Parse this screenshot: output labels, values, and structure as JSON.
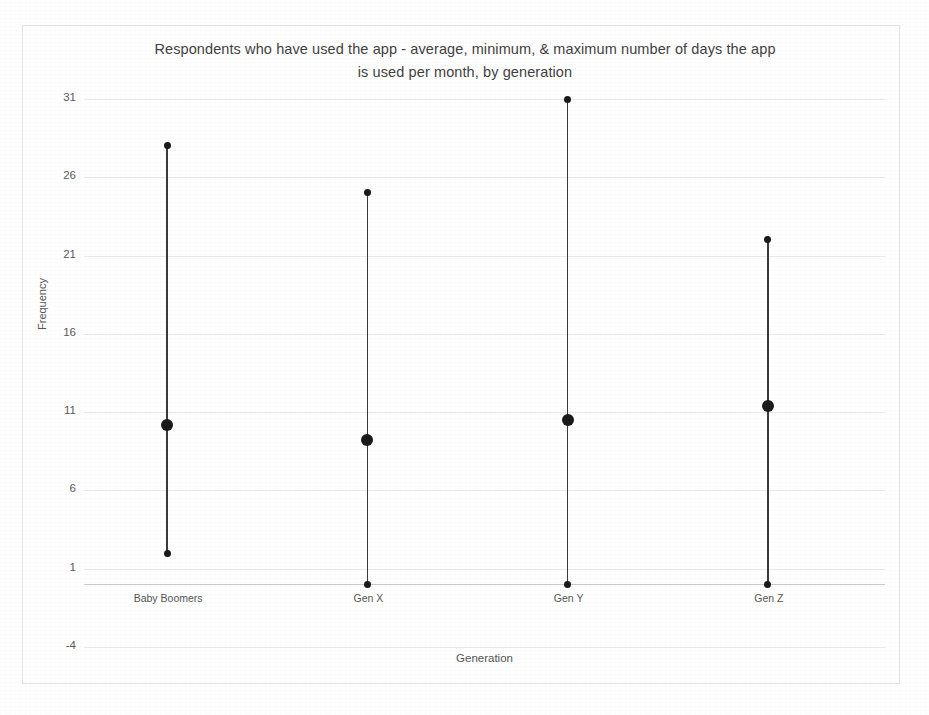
{
  "chart_data": {
    "type": "scatter",
    "title": "Respondents who have used the app - average, minimum, & maximum number of days the app is used per month, by generation",
    "title_line1": "Respondents  who have used the app - average, minimum, & maximum number of days the app",
    "title_line2": "is used per month, by generation",
    "xlabel": "Generation",
    "ylabel": "Frequency",
    "ylim": [
      -4,
      31
    ],
    "yticks": [
      31,
      26,
      21,
      16,
      11,
      6,
      1,
      -4
    ],
    "ytick_labels": [
      "31",
      "26",
      "21",
      "16",
      "11",
      "6",
      "1",
      "-4"
    ],
    "grid": true,
    "legend": "none",
    "categories": [
      "Baby Boomers",
      "Gen X",
      "Gen Y",
      "Gen Z"
    ],
    "series": [
      {
        "name": "minimum",
        "values": [
          2,
          0,
          0,
          0
        ]
      },
      {
        "name": "average",
        "values": [
          10.2,
          9.2,
          10.5,
          11.4
        ]
      },
      {
        "name": "maximum",
        "values": [
          28,
          25,
          31,
          22
        ]
      }
    ],
    "points": [
      {
        "category": "Baby Boomers",
        "minimum": 2,
        "average": 10.2,
        "maximum": 28
      },
      {
        "category": "Gen X",
        "minimum": 0,
        "average": 9.2,
        "maximum": 25
      },
      {
        "category": "Gen Y",
        "minimum": 0,
        "average": 10.5,
        "maximum": 31
      },
      {
        "category": "Gen Z",
        "minimum": 0,
        "average": 11.4,
        "maximum": 22
      }
    ],
    "colors": {
      "marker": "#1a1a1a",
      "line": "#3a3a3a",
      "gridline": "#e8e8e8",
      "axis": "#c9c9c9",
      "text": "#555555",
      "frame": "#e3e3e3"
    }
  }
}
